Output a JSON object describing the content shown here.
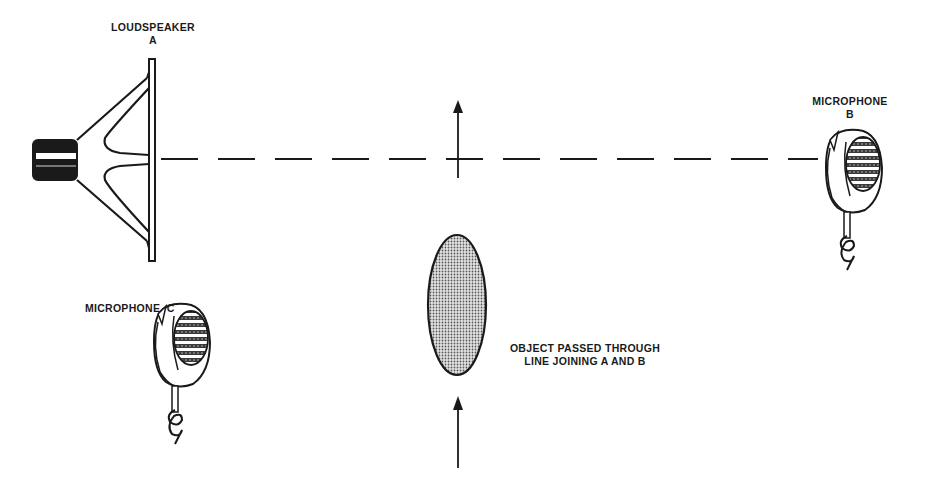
{
  "diagram": {
    "labels": {
      "loudspeaker_name": "LOUDSPEAKER",
      "loudspeaker_id": "A",
      "microphone_b_name": "MICROPHONE",
      "microphone_b_id": "B",
      "microphone_c": "MICROPHONE  C",
      "object_line1": "OBJECT PASSED THROUGH",
      "object_line2": "LINE JOINING A AND B"
    },
    "elements": [
      {
        "id": "loudspeaker-a",
        "type": "loudspeaker-icon",
        "label": "LOUDSPEAKER A"
      },
      {
        "id": "microphone-b",
        "type": "microphone-icon",
        "label": "MICROPHONE B"
      },
      {
        "id": "microphone-c",
        "type": "microphone-icon",
        "label": "MICROPHONE C"
      },
      {
        "id": "object",
        "type": "shaded-ellipse",
        "label": "OBJECT PASSED THROUGH LINE JOINING A AND B"
      },
      {
        "id": "path-line",
        "type": "dashed-line",
        "from": "A",
        "to": "B"
      },
      {
        "id": "motion-arrows",
        "type": "arrow-up",
        "count": 2
      }
    ],
    "colors": {
      "ink": "#1a1a1a",
      "background": "#ffffff",
      "fill_shade": "#9a9a9a"
    }
  }
}
